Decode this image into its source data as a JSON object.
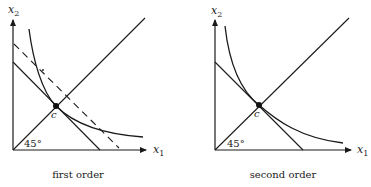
{
  "figure": {
    "panels": [
      {
        "id": "first",
        "caption": "first order",
        "y_axis_label": "x",
        "y_axis_sub": "2",
        "x_axis_label": "x",
        "x_axis_sub": "1",
        "point_label": "c",
        "angle_label": "45°",
        "elements": [
          "45-degree line",
          "indifference curve",
          "budget line (solid)",
          "tangent line (dashed)",
          "point c"
        ]
      },
      {
        "id": "second",
        "caption": "second order",
        "y_axis_label": "x",
        "y_axis_sub": "2",
        "x_axis_label": "x",
        "x_axis_sub": "1",
        "point_label": "c",
        "angle_label": "45°",
        "elements": [
          "45-degree line",
          "indifference curve",
          "budget line (solid)",
          "point c"
        ]
      }
    ]
  }
}
